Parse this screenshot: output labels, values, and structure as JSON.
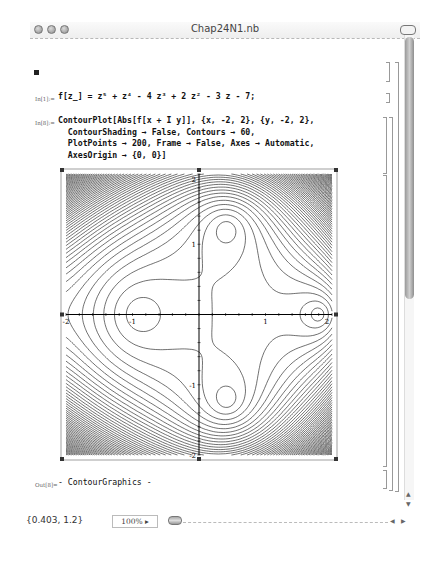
{
  "window": {
    "title": "Chap24N1.nb",
    "buttons": [
      "close",
      "minimize",
      "zoom"
    ]
  },
  "cells": [
    {
      "label": "In[1]:=",
      "code": [
        "f[z_] = z⁵ + z⁴ - 4 z³ + 2 z² - 3 z - 7;"
      ]
    },
    {
      "label": "In[8]:=",
      "code": [
        "ContourPlot[Abs[f[x + I y]], {x, -2, 2}, {y, -2, 2},",
        "  ContourShading → False, Contours → 60,",
        "  PlotPoints → 200, Frame → False, Axes → Automatic,",
        "  AxesOrigin → {0, 0}]"
      ]
    },
    {
      "label": "Out[8]=",
      "code": [
        "- ContourGraphics -"
      ]
    }
  ],
  "plot": {
    "x_ticks": [
      {
        "v": -2,
        "t": "-2"
      },
      {
        "v": -1,
        "t": "-1"
      },
      {
        "v": 1,
        "t": "1"
      },
      {
        "v": 2,
        "t": "2"
      }
    ],
    "y_ticks": [
      {
        "v": 2,
        "t": "2"
      },
      {
        "v": 1,
        "t": "1"
      },
      {
        "v": -1,
        "t": "-1"
      },
      {
        "v": -2,
        "t": "-2"
      }
    ],
    "roots": [
      [
        -1.25,
        0
      ],
      [
        1.47,
        0
      ],
      [
        0.3,
        1.05
      ],
      [
        0.3,
        -1.05
      ]
    ]
  },
  "chart_data": {
    "type": "contour",
    "title": "",
    "function": "|z^5 + z^4 - 4z^3 + 2z^2 - 3z - 7|",
    "xlim": [
      -2,
      2
    ],
    "ylim": [
      -2,
      2
    ],
    "contours": 60,
    "x_ticks": [
      -2,
      -1,
      1,
      2
    ],
    "y_ticks": [
      -2,
      -1,
      1,
      2
    ],
    "minima_locations": [
      [
        -1.25,
        0
      ],
      [
        1.47,
        0
      ],
      [
        0.3,
        1.05
      ],
      [
        0.3,
        -1.05
      ]
    ],
    "grid": false,
    "axes_origin": [
      0,
      0
    ]
  },
  "status": {
    "coordinates": "{0.403, 1.2}",
    "zoom": "100%"
  }
}
